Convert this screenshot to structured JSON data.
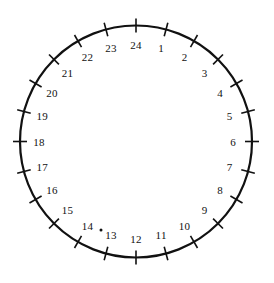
{
  "figure": {
    "type": "circular-dial",
    "background_color": "#ffffff",
    "stroke_color": "#111111",
    "circle": {
      "center_x": 136,
      "center_y": 141.5,
      "radius": 116,
      "stroke_width": 2.2
    },
    "ticks": {
      "count": 24,
      "inner_extent": 7,
      "outer_extent": 7,
      "stroke_width": 1.6
    },
    "labels": {
      "radius": 97,
      "font_size_px": 11,
      "color": "#111111"
    },
    "artifact": {
      "name": "stray-dot-near-14",
      "x": 101,
      "y": 230,
      "size": 1.5
    }
  },
  "chart_data": {
    "type": "scatter",
    "xlabel": "",
    "ylabel": "",
    "divisions": 24,
    "degrees_per_division": 15,
    "orientation": "clockwise",
    "zero_position": "top",
    "tick_labels": [
      "1",
      "2",
      "3",
      "4",
      "5",
      "6",
      "7",
      "8",
      "9",
      "10",
      "11",
      "12",
      "13",
      "14",
      "15",
      "16",
      "17",
      "18",
      "19",
      "20",
      "21",
      "22",
      "23",
      "24"
    ],
    "points": [
      {
        "label": "1",
        "angle_deg": 15
      },
      {
        "label": "2",
        "angle_deg": 30
      },
      {
        "label": "3",
        "angle_deg": 45
      },
      {
        "label": "4",
        "angle_deg": 60
      },
      {
        "label": "5",
        "angle_deg": 75
      },
      {
        "label": "6",
        "angle_deg": 90
      },
      {
        "label": "7",
        "angle_deg": 105
      },
      {
        "label": "8",
        "angle_deg": 120
      },
      {
        "label": "9",
        "angle_deg": 135
      },
      {
        "label": "10",
        "angle_deg": 150
      },
      {
        "label": "11",
        "angle_deg": 165
      },
      {
        "label": "12",
        "angle_deg": 180
      },
      {
        "label": "13",
        "angle_deg": 195
      },
      {
        "label": "14",
        "angle_deg": 210
      },
      {
        "label": "15",
        "angle_deg": 225
      },
      {
        "label": "16",
        "angle_deg": 240
      },
      {
        "label": "17",
        "angle_deg": 255
      },
      {
        "label": "18",
        "angle_deg": 270
      },
      {
        "label": "19",
        "angle_deg": 285
      },
      {
        "label": "20",
        "angle_deg": 300
      },
      {
        "label": "21",
        "angle_deg": 315
      },
      {
        "label": "22",
        "angle_deg": 330
      },
      {
        "label": "23",
        "angle_deg": 345
      },
      {
        "label": "24",
        "angle_deg": 360
      }
    ],
    "legend": [],
    "grid": false
  }
}
